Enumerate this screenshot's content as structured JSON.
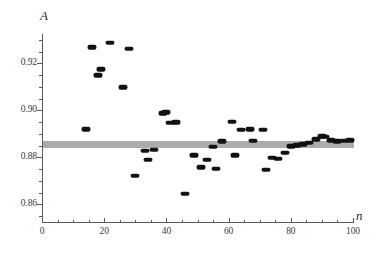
{
  "chart_data": {
    "type": "scatter",
    "title": "",
    "xlabel": "n",
    "ylabel": "A",
    "xlim": [
      0,
      100
    ],
    "ylim": [
      0.8525,
      0.9325
    ],
    "grid": false,
    "legend": null,
    "x_ticks": [
      0,
      20,
      40,
      60,
      80,
      100
    ],
    "x_tick_labels": [
      "0",
      "20",
      "40",
      "60",
      "80",
      "100"
    ],
    "x_minor_step": 5,
    "y_ticks": [
      0.86,
      0.88,
      0.9,
      0.92
    ],
    "y_tick_labels": [
      "0.86",
      "0.88",
      "0.90",
      "0.92"
    ],
    "y_minor_step": 0.005,
    "marker_color": "#111111",
    "reference_line": {
      "value": 0.8862,
      "band_half_width": 0.0009,
      "color": "#9e9e9e",
      "label": ""
    },
    "points": [
      {
        "n": 14,
        "A": 0.892
      },
      {
        "n": 16,
        "A": 0.9268
      },
      {
        "n": 18,
        "A": 0.915
      },
      {
        "n": 19,
        "A": 0.9175
      },
      {
        "n": 22,
        "A": 0.9288
      },
      {
        "n": 26,
        "A": 0.9098
      },
      {
        "n": 28,
        "A": 0.9262
      },
      {
        "n": 30,
        "A": 0.8722
      },
      {
        "n": 33,
        "A": 0.8828
      },
      {
        "n": 34,
        "A": 0.879
      },
      {
        "n": 36,
        "A": 0.8832
      },
      {
        "n": 39,
        "A": 0.8988
      },
      {
        "n": 40,
        "A": 0.8992
      },
      {
        "n": 41,
        "A": 0.8948
      },
      {
        "n": 43,
        "A": 0.895
      },
      {
        "n": 46,
        "A": 0.8645
      },
      {
        "n": 49,
        "A": 0.8808
      },
      {
        "n": 51,
        "A": 0.8758
      },
      {
        "n": 53,
        "A": 0.879
      },
      {
        "n": 55,
        "A": 0.8845
      },
      {
        "n": 56,
        "A": 0.8752
      },
      {
        "n": 58,
        "A": 0.8868
      },
      {
        "n": 61,
        "A": 0.8952
      },
      {
        "n": 62,
        "A": 0.8808
      },
      {
        "n": 64,
        "A": 0.8918
      },
      {
        "n": 67,
        "A": 0.892
      },
      {
        "n": 68,
        "A": 0.887
      },
      {
        "n": 71,
        "A": 0.8918
      },
      {
        "n": 72,
        "A": 0.8748
      },
      {
        "n": 74,
        "A": 0.8798
      },
      {
        "n": 76,
        "A": 0.8795
      },
      {
        "n": 78,
        "A": 0.882
      },
      {
        "n": 80,
        "A": 0.8848
      },
      {
        "n": 82,
        "A": 0.8852
      },
      {
        "n": 84,
        "A": 0.8855
      },
      {
        "n": 86,
        "A": 0.8862
      },
      {
        "n": 88,
        "A": 0.8878
      },
      {
        "n": 90,
        "A": 0.889
      },
      {
        "n": 91,
        "A": 0.8888
      },
      {
        "n": 93,
        "A": 0.8872
      },
      {
        "n": 95,
        "A": 0.8868
      },
      {
        "n": 97,
        "A": 0.887
      },
      {
        "n": 99,
        "A": 0.8872
      }
    ]
  }
}
